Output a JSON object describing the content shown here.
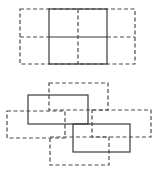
{
  "figures": {
    "top": {
      "description": "Solid 2x2 grid square flanked by dashed squares",
      "dashed_outer": {
        "x": 20,
        "y": 9,
        "w": 115,
        "h": 55
      },
      "solid_center": {
        "x": 49,
        "y": 9,
        "w": 58,
        "h": 55
      },
      "horizontal_mid_y": 37,
      "vertical_mid_x": 78
    },
    "bottom": {
      "description": "Two solid rectangles with surrounding dashed rectangles",
      "dashed_top": {
        "x": 49,
        "y": 83,
        "w": 59,
        "h": 27
      },
      "solid_upper_left": {
        "x": 28,
        "y": 95,
        "w": 60,
        "h": 29
      },
      "dashed_left": {
        "x": 7,
        "y": 111,
        "w": 58,
        "h": 27
      },
      "dashed_right": {
        "x": 92,
        "y": 110,
        "w": 59,
        "h": 27
      },
      "solid_lower_right": {
        "x": 73,
        "y": 124,
        "w": 57,
        "h": 28
      },
      "dashed_bottom": {
        "x": 50,
        "y": 137,
        "w": 59,
        "h": 28
      }
    }
  }
}
